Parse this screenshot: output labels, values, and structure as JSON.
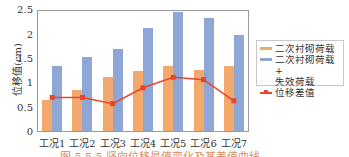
{
  "chart_data": {
    "type": "bar",
    "title": "",
    "xlabel": "",
    "ylabel": "位移值(cm)",
    "ylim": [
      0,
      2.5
    ],
    "yticks": [
      "0",
      "0.5",
      "1",
      "1.5",
      "2",
      "2.5"
    ],
    "categories": [
      "工况1",
      "工况2",
      "工况3",
      "工况4",
      "工况5",
      "工况6",
      "工况7"
    ],
    "series": [
      {
        "name": "二次衬砌荷载",
        "type": "bar",
        "color": "#f2a96b",
        "values": [
          0.65,
          0.85,
          1.12,
          1.25,
          1.35,
          1.28,
          1.35
        ]
      },
      {
        "name": "二次衬砌荷载+失效荷载",
        "type": "bar",
        "color": "#8ea7d6",
        "values": [
          1.35,
          1.55,
          1.7,
          2.15,
          2.48,
          2.35,
          2.0
        ]
      },
      {
        "name": "位移差值",
        "type": "line",
        "color": "#e8452c",
        "values": [
          0.7,
          0.7,
          0.57,
          0.9,
          1.12,
          1.07,
          0.63
        ]
      }
    ],
    "legend_position": "right",
    "grid": false
  },
  "axis": {
    "ylabel": "位移值(cm)",
    "yticks": [
      "0",
      "0.5",
      "1",
      "1.5",
      "2",
      "2.5"
    ],
    "xticks": [
      "工况1",
      "工况2",
      "工况3",
      "工况4",
      "工况5",
      "工况6",
      "工况7"
    ]
  },
  "legend": {
    "items": [
      {
        "label": "二次衬砌荷载",
        "color": "#f2a96b"
      },
      {
        "label": "二次衬砌荷载+失效荷载",
        "label_line1": "二次衬砌荷载+",
        "label_line2": "失效荷载",
        "color": "#8ea7d6"
      },
      {
        "label": "位移差值",
        "color": "#e8452c"
      }
    ]
  },
  "caption": "图 5.5.5  竖向位移最值变化及其差值曲线"
}
